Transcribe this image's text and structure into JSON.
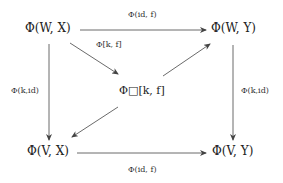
{
  "diagram": {
    "type": "commutative-diagram",
    "nodes": {
      "top_left": "Φ(W, X)",
      "top_right": "Φ(W, Y)",
      "center": "Φ□[k, f]",
      "bottom_left": "Φ(V, X)",
      "bottom_right": "Φ(V, Y)"
    },
    "edges": {
      "top": {
        "from": "top_left",
        "to": "top_right",
        "label": "Φ(id, f)"
      },
      "diag_in": {
        "from": "top_left",
        "to": "center",
        "label": "Φ[k, f]"
      },
      "diag_out_up": {
        "from": "center",
        "to": "top_right",
        "label": ""
      },
      "diag_out_down": {
        "from": "center",
        "to": "bottom_left",
        "label": ""
      },
      "left": {
        "from": "top_left",
        "to": "bottom_left",
        "label": "Φ(k,id)"
      },
      "right": {
        "from": "top_right",
        "to": "bottom_right",
        "label": "Φ(k,id)"
      },
      "bottom": {
        "from": "bottom_left",
        "to": "bottom_right",
        "label": "Φ(id, f)"
      }
    },
    "line_color": "#444444"
  }
}
